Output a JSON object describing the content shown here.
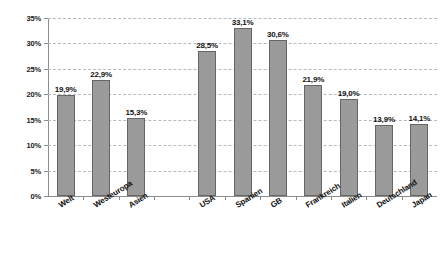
{
  "chart_data": {
    "type": "bar",
    "title": "",
    "subtitle": "",
    "xlabel": "",
    "ylabel": "",
    "ylim": [
      0,
      35
    ],
    "ytick_labels": [
      "0%",
      "5%",
      "10%",
      "15%",
      "20%",
      "25%",
      "30%",
      "35%"
    ],
    "ytick_values": [
      0,
      5,
      10,
      15,
      20,
      25,
      30,
      35
    ],
    "grid": true,
    "legend": "none",
    "decimal_separator": ",",
    "unit": "%",
    "categories": [
      "Welt",
      "Westeuropa",
      "Asien",
      "",
      "USA",
      "Spanien",
      "GB",
      "Frankreich",
      "Italien",
      "Deutschland",
      "Japan"
    ],
    "values": [
      19.9,
      22.9,
      15.3,
      null,
      28.5,
      33.1,
      30.6,
      21.9,
      19.0,
      13.9,
      14.1
    ],
    "data_labels": [
      "19,9%",
      "22,9%",
      "15,3%",
      "",
      "28,5%",
      "33,1%",
      "30,6%",
      "21,9%",
      "19,0%",
      "13,9%",
      "14,1%"
    ],
    "bars": [
      {
        "category": "Welt",
        "value": 19.9,
        "label": "19,9%"
      },
      {
        "category": "Westeuropa",
        "value": 22.9,
        "label": "22,9%"
      },
      {
        "category": "Asien",
        "value": 15.3,
        "label": "15,3%"
      },
      {
        "category": "",
        "value": null,
        "label": ""
      },
      {
        "category": "USA",
        "value": 28.5,
        "label": "28,5%"
      },
      {
        "category": "Spanien",
        "value": 33.1,
        "label": "33,1%"
      },
      {
        "category": "GB",
        "value": 30.6,
        "label": "30,6%"
      },
      {
        "category": "Frankreich",
        "value": 21.9,
        "label": "21,9%"
      },
      {
        "category": "Italien",
        "value": 19.0,
        "label": "19,0%"
      },
      {
        "category": "Deutschland",
        "value": 13.9,
        "label": "13,9%"
      },
      {
        "category": "Japan",
        "value": 14.1,
        "label": "14,1%"
      }
    ],
    "colors": {
      "bar_fill": "#9a9a9a",
      "bar_border": "#666666",
      "gridline": "#b9b9c6",
      "axis": "#8d8d8d",
      "text": "#111111",
      "background": "#ffffff"
    }
  }
}
